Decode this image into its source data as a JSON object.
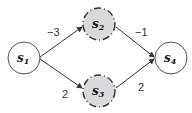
{
  "diagram": {
    "type": "directed-graph",
    "nodes": [
      {
        "id": "s1",
        "base": "s",
        "sub": "1",
        "cx": 24,
        "cy": 58,
        "r": 16,
        "fill": "#ffffff",
        "stroke": "#555555",
        "dashed": false
      },
      {
        "id": "s2",
        "base": "s",
        "sub": "2",
        "cx": 99,
        "cy": 24,
        "r": 16,
        "fill": "#d9d9d9",
        "stroke": "#333333",
        "dashed": true
      },
      {
        "id": "s3",
        "base": "s",
        "sub": "3",
        "cx": 99,
        "cy": 91,
        "r": 16,
        "fill": "#d9d9d9",
        "stroke": "#333333",
        "dashed": true
      },
      {
        "id": "s4",
        "base": "s",
        "sub": "4",
        "cx": 171,
        "cy": 58,
        "r": 16,
        "fill": "#ffffff",
        "stroke": "#555555",
        "dashed": false
      }
    ],
    "edges": [
      {
        "from": "s1",
        "to": "s2",
        "weight": "−3",
        "label_x": 52,
        "label_y": 37
      },
      {
        "from": "s2",
        "to": "s4",
        "weight": "−1",
        "label_x": 140,
        "label_y": 37
      },
      {
        "from": "s1",
        "to": "s3",
        "weight": "2",
        "label_x": 63,
        "label_y": 98
      },
      {
        "from": "s3",
        "to": "s4",
        "weight": "2",
        "label_x": 139,
        "label_y": 91
      }
    ]
  }
}
